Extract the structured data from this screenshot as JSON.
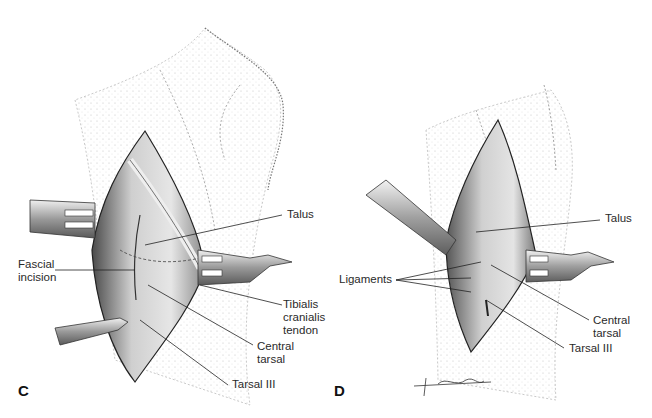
{
  "figure": {
    "panels": [
      {
        "id": "C",
        "letter": "C",
        "labels": {
          "talus": "Talus",
          "fascial_incision": "Fascial\nincision",
          "tibialis": "Tibialis\ncranialis\ntendon",
          "central_tarsal": "Central\ntarsal",
          "tarsal_iii": "Tarsal III"
        }
      },
      {
        "id": "D",
        "letter": "D",
        "labels": {
          "talus": "Talus",
          "ligaments": "Ligaments",
          "central_tarsal": "Central\ntarsal",
          "tarsal_iii": "Tarsal III"
        },
        "signature": "Giddings"
      }
    ],
    "colors": {
      "ink": "#1a1a1a",
      "stipple": "#9a9a9a",
      "tissue_dark": "#5a5a5a",
      "tissue_mid": "#a8a8a8",
      "tissue_light": "#dcdcdc",
      "background": "#ffffff"
    }
  }
}
